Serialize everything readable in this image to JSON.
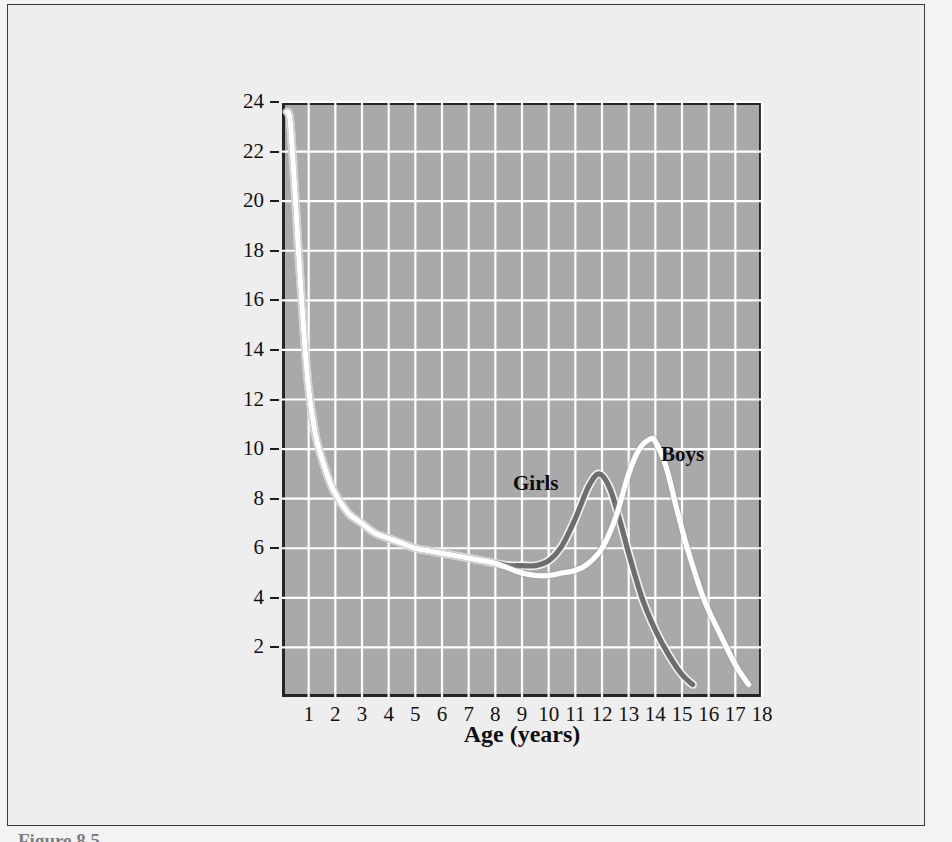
{
  "figure": {
    "background_color": "#eeeeee",
    "plot_background_color": "#a9a9a9",
    "gridline_color": "#ffffff",
    "axis_color": "#252525"
  },
  "labels": {
    "girls": "Girls",
    "boys": "Boys"
  },
  "caption": "Figure 8.5",
  "chart_data": {
    "type": "line",
    "title": "",
    "xlabel": "Age (years)",
    "ylabel": "Height gain per year (cm)",
    "xlim": [
      0,
      18
    ],
    "ylim": [
      0,
      24
    ],
    "grid": true,
    "legend_position": "inline-annotation",
    "xticks": [
      1,
      2,
      3,
      4,
      5,
      6,
      7,
      8,
      9,
      10,
      11,
      12,
      13,
      14,
      15,
      16,
      17,
      18
    ],
    "xtick_labels": [
      "1",
      "2",
      "3",
      "4",
      "5",
      "6",
      "7",
      "8",
      "9",
      "10",
      "11",
      "12",
      "13",
      "14",
      "15",
      "16",
      "17",
      "18"
    ],
    "yticks": [
      2,
      4,
      6,
      8,
      10,
      12,
      14,
      16,
      18,
      20,
      22,
      24
    ],
    "ytick_labels": [
      "2",
      "4",
      "6",
      "8",
      "10",
      "12",
      "14",
      "16",
      "18",
      "20",
      "22",
      "24"
    ],
    "series": [
      {
        "name": "Girls",
        "color": "#6e6e6e",
        "x": [
          0.18,
          0.3,
          0.45,
          0.6,
          0.8,
          1.0,
          1.25,
          1.5,
          1.75,
          2.0,
          2.5,
          3.0,
          3.5,
          4.0,
          4.5,
          5.0,
          5.5,
          6.0,
          6.5,
          7.0,
          7.5,
          8.0,
          8.5,
          9.0,
          9.5,
          10.0,
          10.5,
          11.0,
          11.5,
          11.9,
          12.3,
          12.7,
          13.0,
          13.5,
          14.0,
          14.5,
          15.0,
          15.4
        ],
        "y": [
          23.6,
          23.3,
          21.0,
          18.3,
          15.0,
          12.4,
          10.6,
          9.6,
          8.8,
          8.2,
          7.4,
          7.0,
          6.6,
          6.4,
          6.2,
          6.0,
          5.9,
          5.8,
          5.7,
          5.6,
          5.5,
          5.4,
          5.3,
          5.3,
          5.3,
          5.5,
          6.1,
          7.2,
          8.5,
          9.0,
          8.4,
          7.0,
          5.8,
          4.0,
          2.7,
          1.7,
          0.9,
          0.5
        ]
      },
      {
        "name": "Boys",
        "color": "#ffffff",
        "x": [
          0.18,
          0.3,
          0.45,
          0.6,
          0.8,
          1.0,
          1.25,
          1.5,
          1.75,
          2.0,
          2.5,
          3.0,
          3.5,
          4.0,
          4.5,
          5.0,
          5.5,
          6.0,
          6.5,
          7.0,
          7.5,
          8.0,
          8.5,
          9.0,
          9.5,
          10.0,
          10.5,
          11.0,
          11.5,
          12.0,
          12.5,
          13.0,
          13.4,
          13.8,
          14.0,
          14.4,
          14.8,
          15.2,
          15.8,
          16.4,
          17.0,
          17.5
        ],
        "y": [
          23.6,
          23.3,
          21.0,
          18.3,
          15.0,
          12.4,
          10.6,
          9.6,
          8.8,
          8.2,
          7.4,
          7.0,
          6.6,
          6.4,
          6.2,
          6.0,
          5.9,
          5.8,
          5.7,
          5.6,
          5.5,
          5.4,
          5.2,
          5.0,
          4.9,
          4.9,
          5.0,
          5.1,
          5.4,
          6.0,
          7.2,
          9.0,
          10.0,
          10.4,
          10.3,
          9.3,
          7.6,
          6.0,
          4.0,
          2.6,
          1.3,
          0.5
        ]
      }
    ],
    "annotations": [
      {
        "text": "Girls",
        "x": 9.3,
        "y": 8.6
      },
      {
        "text": "Boys",
        "x": 14.9,
        "y": 9.8
      }
    ]
  }
}
